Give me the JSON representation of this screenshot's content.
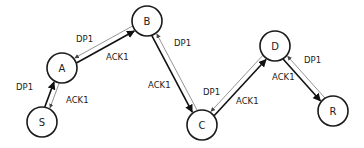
{
  "diagram": {
    "nodes": [
      {
        "id": "S",
        "label": "S",
        "x": 42,
        "y": 122,
        "r": 15
      },
      {
        "id": "A",
        "label": "A",
        "x": 62,
        "y": 68,
        "r": 15
      },
      {
        "id": "B",
        "label": "B",
        "x": 147,
        "y": 21,
        "r": 15
      },
      {
        "id": "C",
        "label": "C",
        "x": 202,
        "y": 125,
        "r": 15
      },
      {
        "id": "D",
        "label": "D",
        "x": 275,
        "y": 46,
        "r": 15
      },
      {
        "id": "R",
        "label": "R",
        "x": 333,
        "y": 111,
        "r": 15
      }
    ],
    "edges": [
      {
        "from": "S",
        "to": "A",
        "type": "data",
        "label": "DP1",
        "lx": 16,
        "ly": 90
      },
      {
        "from": "A",
        "to": "S",
        "type": "ack",
        "label": "ACK1",
        "lx": 66,
        "ly": 103
      },
      {
        "from": "A",
        "to": "B",
        "type": "data",
        "label": "DP1",
        "lx": 76,
        "ly": 42
      },
      {
        "from": "B",
        "to": "A",
        "type": "ack",
        "label": "ACK1",
        "lx": 106,
        "ly": 60
      },
      {
        "from": "B",
        "to": "C",
        "type": "data",
        "label": "DP1",
        "lx": 174,
        "ly": 46
      },
      {
        "from": "C",
        "to": "B",
        "type": "ack",
        "label": "ACK1",
        "lx": 148,
        "ly": 88
      },
      {
        "from": "C",
        "to": "D",
        "type": "data",
        "label": "DP1",
        "lx": 203,
        "ly": 95
      },
      {
        "from": "D",
        "to": "C",
        "type": "ack",
        "label": "ACK1",
        "lx": 236,
        "ly": 104
      },
      {
        "from": "D",
        "to": "R",
        "type": "data",
        "label": "DP1",
        "lx": 304,
        "ly": 63
      },
      {
        "from": "R",
        "to": "D",
        "type": "ack",
        "label": "ACK1",
        "lx": 272,
        "ly": 80
      }
    ]
  }
}
